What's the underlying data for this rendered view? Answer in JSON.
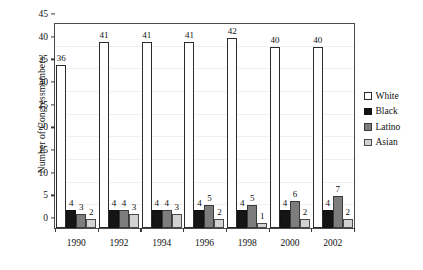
{
  "chart_data": {
    "type": "bar",
    "title": "",
    "xlabel": "",
    "ylabel": "Number of Congressmembers",
    "categories": [
      "1990",
      "1992",
      "1994",
      "1996",
      "1998",
      "2000",
      "2002"
    ],
    "ylim": [
      0,
      45
    ],
    "yticks": [
      "0",
      "5",
      "10",
      "15",
      "20",
      "25",
      "30",
      "35",
      "40",
      "45"
    ],
    "grid": true,
    "legend_position": "right",
    "series": [
      {
        "name": "White",
        "color": "#ffffff",
        "values": [
          36,
          41,
          41,
          41,
          42,
          40,
          40
        ]
      },
      {
        "name": "Black",
        "color": "#151515",
        "values": [
          4,
          4,
          4,
          4,
          4,
          4,
          4
        ]
      },
      {
        "name": "Latino",
        "color": "#7d7d7d",
        "values": [
          3,
          4,
          4,
          5,
          5,
          6,
          7
        ]
      },
      {
        "name": "Asian",
        "color": "#d2d2d2",
        "values": [
          2,
          3,
          3,
          2,
          1,
          2,
          2
        ]
      }
    ]
  }
}
